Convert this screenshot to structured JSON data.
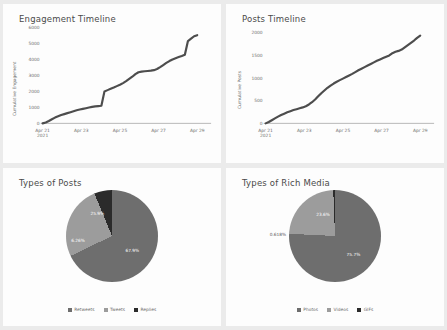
{
  "panels": {
    "engagement": {
      "title": "Engagement Timeline"
    },
    "posts": {
      "title": "Posts Timeline"
    },
    "types_of_posts": {
      "title": "Types of Posts"
    },
    "types_of_rich_media": {
      "title": "Types of Rich Media"
    }
  },
  "colors": {
    "line": "#4d4d4d",
    "axis": "#9a9a9a",
    "panel_bg": "#fdfdfd",
    "page_bg": "#ebebeb",
    "slice_1": "#6e6e6e",
    "slice_2": "#9c9c9c",
    "slice_3": "#2b2b2b"
  },
  "chart_data": [
    {
      "type": "line",
      "title": "Engagement Timeline",
      "xlabel": "",
      "ylabel": "Cumulative Engagement",
      "ylim": [
        0,
        6000
      ],
      "yticks": [
        "0",
        "1000",
        "2000",
        "3000",
        "4000",
        "5000",
        "6000"
      ],
      "xticks": [
        "Apr 21",
        "Apr 23",
        "Apr 25",
        "Apr 27",
        "Apr 29"
      ],
      "xtick_sublabel": "2021",
      "grid": false,
      "x": [
        0,
        2,
        4,
        6,
        8,
        10,
        12,
        14,
        16,
        18,
        20,
        22,
        24,
        26,
        28,
        30,
        32,
        34,
        36,
        38,
        40,
        42,
        44,
        46,
        48,
        50,
        52,
        54,
        56,
        58,
        60,
        62,
        64,
        66,
        68,
        70,
        72,
        74,
        76,
        78,
        80,
        82,
        84,
        86,
        88,
        90,
        92,
        94,
        96,
        98,
        100
      ],
      "values": [
        0,
        60,
        150,
        260,
        360,
        440,
        520,
        580,
        640,
        700,
        760,
        820,
        870,
        910,
        950,
        990,
        1030,
        1060,
        1080,
        1100,
        2000,
        2080,
        2160,
        2240,
        2330,
        2420,
        2520,
        2640,
        2780,
        2920,
        3080,
        3200,
        3240,
        3260,
        3280,
        3300,
        3330,
        3400,
        3520,
        3650,
        3780,
        3900,
        4000,
        4080,
        4150,
        4220,
        4300,
        5150,
        5300,
        5450,
        5520
      ]
    },
    {
      "type": "line",
      "title": "Posts Timeline",
      "xlabel": "",
      "ylabel": "Cumulative Posts",
      "ylim": [
        0,
        2000
      ],
      "yticks": [
        "0",
        "500",
        "1000",
        "1500",
        "2000"
      ],
      "xticks": [
        "Apr 21",
        "Apr 23",
        "Apr 25",
        "Apr 27",
        "Apr 29"
      ],
      "xtick_sublabel": "2021",
      "grid": false,
      "x": [
        0,
        2,
        4,
        6,
        8,
        10,
        12,
        14,
        16,
        18,
        20,
        22,
        24,
        26,
        28,
        30,
        32,
        34,
        36,
        38,
        40,
        42,
        44,
        46,
        48,
        50,
        52,
        54,
        56,
        58,
        60,
        62,
        64,
        66,
        68,
        70,
        72,
        74,
        76,
        78,
        80,
        82,
        84,
        86,
        88,
        90,
        92,
        94,
        96,
        98,
        100
      ],
      "values": [
        0,
        30,
        70,
        110,
        150,
        185,
        215,
        245,
        270,
        295,
        315,
        335,
        355,
        380,
        420,
        470,
        530,
        600,
        670,
        730,
        790,
        840,
        885,
        925,
        960,
        995,
        1030,
        1065,
        1100,
        1140,
        1180,
        1215,
        1250,
        1285,
        1320,
        1355,
        1390,
        1420,
        1450,
        1480,
        1510,
        1560,
        1590,
        1610,
        1640,
        1690,
        1740,
        1790,
        1840,
        1900,
        1950
      ]
    },
    {
      "type": "pie",
      "title": "Types of Posts",
      "labels": [
        "Retweets",
        "Tweets",
        "Replies"
      ],
      "values": [
        67.9,
        25.9,
        6.26
      ],
      "value_labels": [
        "67.9%",
        "25.9%",
        "6.26%"
      ],
      "colors": [
        "#6e6e6e",
        "#9c9c9c",
        "#2b2b2b"
      ],
      "legend_position": "bottom"
    },
    {
      "type": "pie",
      "title": "Types of Rich Media",
      "labels": [
        "Photos",
        "Videos",
        "GIFs"
      ],
      "values": [
        75.7,
        23.6,
        0.618
      ],
      "value_labels": [
        "75.7%",
        "23.6%",
        "0.618%"
      ],
      "colors": [
        "#6e6e6e",
        "#9c9c9c",
        "#2b2b2b"
      ],
      "legend_position": "bottom"
    }
  ]
}
